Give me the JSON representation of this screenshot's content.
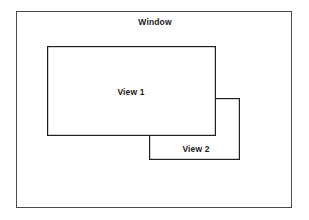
{
  "diagram": {
    "title": "Window",
    "background_color": "#ffffff",
    "stroke_color": "#4a4a4a",
    "inner_stroke_color": "#1f1f1f",
    "text_color": "#1a1a1a",
    "shapes": [
      {
        "id": "window",
        "name": "Window",
        "label": "Window",
        "kind": "rectangle",
        "x": 16,
        "y": 11,
        "width": 276,
        "height": 197,
        "label_x": 155,
        "label_y": 22,
        "z": 1
      },
      {
        "id": "view2",
        "name": "View 2",
        "label": "View 2",
        "kind": "rectangle",
        "x": 149,
        "y": 98,
        "width": 91,
        "height": 62,
        "label_x": 196,
        "label_y": 149,
        "z": 2,
        "occluded_by": "view1"
      },
      {
        "id": "view1",
        "name": "View 1",
        "label": "View 1",
        "kind": "rectangle",
        "x": 47,
        "y": 46,
        "width": 169,
        "height": 90,
        "label_x": 131,
        "label_y": 92,
        "z": 3
      }
    ]
  }
}
